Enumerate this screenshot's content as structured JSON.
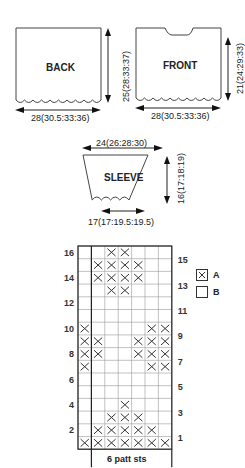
{
  "pieces": {
    "back": {
      "label": "BACK",
      "width_dim": "28(30.5:33:36)",
      "height_dim": "25(28:33:37)"
    },
    "front": {
      "label": "FRONT",
      "width_dim": "28(30.5:33:36)",
      "height_dim": "21(24:29:33)"
    },
    "sleeve": {
      "label": "SLEEVE",
      "top_dim": "24(26:28:30)",
      "bottom_dim": "17(17:19.5:19.5)",
      "height_dim": "16(17:18:19)"
    }
  },
  "chart": {
    "footer_label": "6 patt sts",
    "rows_total": 16,
    "cols_total": 7,
    "left_row_numbers": [
      "16",
      "14",
      "12",
      "10",
      "8",
      "6",
      "4",
      "2"
    ],
    "right_row_numbers": [
      "15",
      "13",
      "11",
      "9",
      "7",
      "5",
      "3",
      "1"
    ],
    "legend": [
      {
        "symbol": "X",
        "label": "A"
      },
      {
        "symbol": "",
        "label": "B"
      }
    ]
  },
  "chart_data": {
    "type": "heatmap",
    "xlabel": "6 patt sts",
    "ylabel": "Rows 1-16",
    "legend": {
      "X": "A",
      "blank": "B"
    },
    "columns": 7,
    "rows_bottom_to_top": {
      "1": [
        1,
        1,
        1,
        1,
        1,
        1,
        1
      ],
      "2": [
        0,
        1,
        1,
        1,
        1,
        1,
        0
      ],
      "3": [
        0,
        0,
        1,
        1,
        1,
        0,
        0
      ],
      "4": [
        0,
        0,
        0,
        1,
        0,
        0,
        0
      ],
      "5": [
        0,
        0,
        0,
        0,
        0,
        0,
        0
      ],
      "6": [
        0,
        0,
        0,
        0,
        0,
        0,
        0
      ],
      "7": [
        1,
        0,
        0,
        0,
        0,
        1,
        1
      ],
      "8": [
        1,
        1,
        0,
        0,
        1,
        1,
        1
      ],
      "9": [
        1,
        1,
        0,
        0,
        1,
        1,
        1
      ],
      "10": [
        1,
        0,
        0,
        0,
        0,
        1,
        1
      ],
      "11": [
        0,
        0,
        0,
        0,
        0,
        0,
        0
      ],
      "12": [
        0,
        0,
        0,
        0,
        0,
        0,
        0
      ],
      "13": [
        0,
        0,
        1,
        1,
        0,
        0,
        0
      ],
      "14": [
        0,
        1,
        1,
        1,
        1,
        0,
        0
      ],
      "15": [
        0,
        1,
        1,
        1,
        1,
        0,
        0
      ],
      "16": [
        0,
        0,
        1,
        1,
        0,
        0,
        0
      ]
    }
  }
}
